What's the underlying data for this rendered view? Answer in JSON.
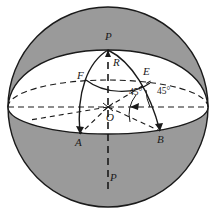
{
  "figure": {
    "name": "sphere-spherical-triangle-diagram",
    "caption": "",
    "colors": {
      "shaded_sphere": "#9a9a9a",
      "spherical_cap": "#ffffff",
      "outline": "#1a1a1a",
      "dashed": "#1a1a1a",
      "label_text": "#1a1a1a"
    },
    "geometry": {
      "sphere_center_x": 108,
      "sphere_center_y": 107,
      "sphere_radius": 100,
      "north_pole_x": 108,
      "north_pole_y": 50,
      "equator_ellipse_ry": 27
    },
    "labels": [
      {
        "id": "pole-top",
        "text": "P",
        "x": 105,
        "y": 36,
        "style": "italic"
      },
      {
        "id": "radius-r",
        "text": "R",
        "x": 113,
        "y": 59,
        "style": "italic"
      },
      {
        "id": "arc-f",
        "text": "F",
        "x": 78,
        "y": 72,
        "style": "italic"
      },
      {
        "id": "arc-e",
        "text": "E",
        "x": 144,
        "y": 68,
        "style": "italic"
      },
      {
        "id": "angle-left",
        "text": "45°",
        "x": 129,
        "y": 91,
        "style": "upright"
      },
      {
        "id": "angle-right",
        "text": "45°",
        "x": 156,
        "y": 90,
        "style": "upright"
      },
      {
        "id": "center-o",
        "text": "O",
        "x": 107,
        "y": 113,
        "style": "italic"
      },
      {
        "id": "point-a",
        "text": "A",
        "x": 75,
        "y": 139,
        "style": "italic"
      },
      {
        "id": "point-b",
        "text": "B",
        "x": 158,
        "y": 136,
        "style": "italic"
      },
      {
        "id": "pole-bottom",
        "text": "P",
        "x": 108,
        "y": 176,
        "style": "italic"
      }
    ],
    "annotations": {
      "pole_top_label": "P",
      "pole_bottom_label": "P",
      "radius_label": "R",
      "arc_f_label": "F",
      "arc_e_label": "E",
      "center_label": "O",
      "vertex_a_label": "A",
      "vertex_b_label": "B",
      "angle_left_label": "45°",
      "angle_right_label": "45°"
    }
  }
}
